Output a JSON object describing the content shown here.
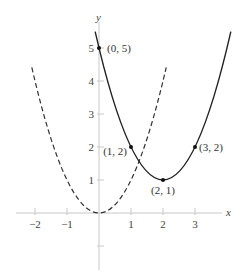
{
  "chart_data": {
    "type": "line",
    "title": "",
    "xlabel": "x",
    "ylabel": "y",
    "xlim": [
      -2.5,
      4.3
    ],
    "ylim": [
      -1.7,
      5.6
    ],
    "grid": false,
    "legend": null,
    "x_ticks": [
      {
        "value": -2,
        "label": "−2"
      },
      {
        "value": -1,
        "label": "−1"
      },
      {
        "value": 1,
        "label": "1"
      },
      {
        "value": 2,
        "label": "2"
      },
      {
        "value": 3,
        "label": "3"
      }
    ],
    "y_ticks": [
      {
        "value": 1,
        "label": "1"
      },
      {
        "value": 2,
        "label": "2"
      },
      {
        "value": 3,
        "label": "3"
      },
      {
        "value": 4,
        "label": "4"
      },
      {
        "value": 5,
        "label": "5"
      },
      {
        "value": -1,
        "label": ""
      }
    ],
    "series": [
      {
        "name": "y = x^2",
        "style": "dashed",
        "equation": "y = x^2",
        "x_range": [
          -2.1,
          2.1
        ],
        "vertex": [
          0,
          0
        ]
      },
      {
        "name": "y = (x - 2)^2 + 1",
        "style": "solid",
        "equation": "y = (x-2)^2 + 1",
        "x_range": [
          -0.12,
          4.12
        ],
        "vertex": [
          2,
          1
        ]
      }
    ],
    "annotations": [
      {
        "x": 0,
        "y": 5,
        "label": "(0, 5)",
        "dx": 8,
        "dy": 4,
        "anchor": "start"
      },
      {
        "x": 1,
        "y": 2,
        "label": "(1, 2)",
        "dx": -4,
        "dy": 8,
        "anchor": "end"
      },
      {
        "x": 2,
        "y": 1,
        "label": "(2, 1)",
        "dx": 0,
        "dy": 14,
        "anchor": "middle"
      },
      {
        "x": 3,
        "y": 2,
        "label": "(3, 2)",
        "dx": 4,
        "dy": 4,
        "anchor": "start"
      }
    ]
  }
}
